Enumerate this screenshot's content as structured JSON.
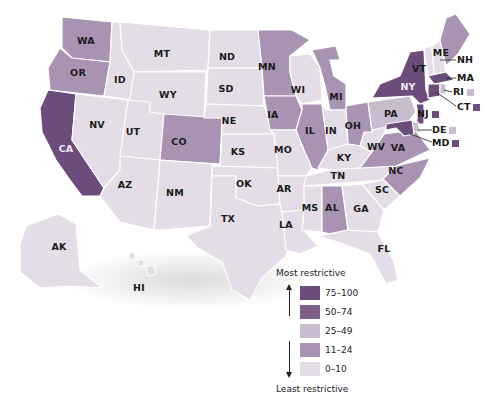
{
  "legend": {
    "top_label": "Most restrictive",
    "bottom_label": "Least restrictive",
    "bins": [
      {
        "range": "75–100",
        "color": "#6b4c7a"
      },
      {
        "range": "50–74",
        "color": "#7d6089"
      },
      {
        "range": "25–49",
        "color": "#c9bccf"
      },
      {
        "range": "11–24",
        "color": "#a993b2"
      },
      {
        "range": "0–10",
        "color": "#e4dde7"
      }
    ]
  },
  "states": {
    "WA": {
      "label": "WA",
      "bin": "11–24"
    },
    "OR": {
      "label": "OR",
      "bin": "11–24"
    },
    "CA": {
      "label": "CA",
      "bin": "75–100"
    },
    "ID": {
      "label": "ID",
      "bin": "0–10"
    },
    "NV": {
      "label": "NV",
      "bin": "0–10"
    },
    "MT": {
      "label": "MT",
      "bin": "0–10"
    },
    "WY": {
      "label": "WY",
      "bin": "0–10"
    },
    "UT": {
      "label": "UT",
      "bin": "0–10"
    },
    "AZ": {
      "label": "AZ",
      "bin": "0–10"
    },
    "CO": {
      "label": "CO",
      "bin": "11–24"
    },
    "NM": {
      "label": "NM",
      "bin": "0–10"
    },
    "ND": {
      "label": "ND",
      "bin": "0–10"
    },
    "SD": {
      "label": "SD",
      "bin": "0–10"
    },
    "NE": {
      "label": "NE",
      "bin": "0–10"
    },
    "KS": {
      "label": "KS",
      "bin": "0–10"
    },
    "OK": {
      "label": "OK",
      "bin": "0–10"
    },
    "TX": {
      "label": "TX",
      "bin": "0–10"
    },
    "MN": {
      "label": "MN",
      "bin": "11–24"
    },
    "IA": {
      "label": "IA",
      "bin": "11–24"
    },
    "MO": {
      "label": "MO",
      "bin": "0–10"
    },
    "AR": {
      "label": "AR",
      "bin": "0–10"
    },
    "LA": {
      "label": "LA",
      "bin": "0–10"
    },
    "WI": {
      "label": "WI",
      "bin": "0–10"
    },
    "IL": {
      "label": "IL",
      "bin": "11–24"
    },
    "MI": {
      "label": "MI",
      "bin": "11–24"
    },
    "IN": {
      "label": "IN",
      "bin": "0–10"
    },
    "OH": {
      "label": "OH",
      "bin": "11–24"
    },
    "KY": {
      "label": "KY",
      "bin": "0–10"
    },
    "TN": {
      "label": "TN",
      "bin": "0–10"
    },
    "MS": {
      "label": "MS",
      "bin": "0–10"
    },
    "AL": {
      "label": "AL",
      "bin": "11–24"
    },
    "GA": {
      "label": "GA",
      "bin": "0–10"
    },
    "FL": {
      "label": "FL",
      "bin": "0–10"
    },
    "SC": {
      "label": "SC",
      "bin": "0–10"
    },
    "NC": {
      "label": "NC",
      "bin": "11–24"
    },
    "VA": {
      "label": "VA",
      "bin": "11–24"
    },
    "WV": {
      "label": "WV",
      "bin": "0–10"
    },
    "PA": {
      "label": "PA",
      "bin": "25–49"
    },
    "NY": {
      "label": "NY",
      "bin": "75–100"
    },
    "VT": {
      "label": "VT",
      "bin": "0–10"
    },
    "NH": {
      "label": "NH",
      "bin": "0–10"
    },
    "ME": {
      "label": "ME",
      "bin": "11–24"
    },
    "MA": {
      "label": "MA",
      "bin": "75–100"
    },
    "RI": {
      "label": "RI",
      "bin": "25–49"
    },
    "CT": {
      "label": "CT",
      "bin": "75–100"
    },
    "NJ": {
      "label": "NJ",
      "bin": "75–100"
    },
    "DE": {
      "label": "DE",
      "bin": "25–49"
    },
    "MD": {
      "label": "MD",
      "bin": "75–100"
    },
    "AK": {
      "label": "AK",
      "bin": "0–10"
    },
    "HI": {
      "label": "HI",
      "bin": "0–10"
    }
  }
}
